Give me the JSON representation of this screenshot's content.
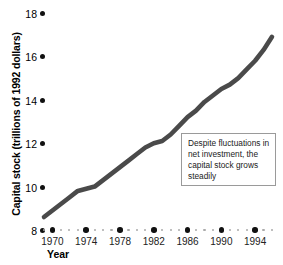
{
  "chart_data": {
    "type": "line",
    "title": "",
    "xlabel": "Year",
    "ylabel": "Capital stock (trillions of 1992 dollars)",
    "xlim": [
      1969,
      1996
    ],
    "ylim": [
      8,
      18
    ],
    "grid": false,
    "legend": null,
    "y_ticks": [
      18,
      16,
      14,
      12,
      10,
      8
    ],
    "x_ticks": [
      1970,
      1974,
      1978,
      1982,
      1986,
      1990,
      1994
    ],
    "line_color": "#4a4a4a",
    "series": [
      {
        "name": "Capital stock",
        "x": [
          1969,
          1970,
          1971,
          1972,
          1973,
          1974,
          1975,
          1976,
          1977,
          1978,
          1979,
          1980,
          1981,
          1982,
          1983,
          1984,
          1985,
          1986,
          1987,
          1988,
          1989,
          1990,
          1991,
          1992,
          1993,
          1994,
          1995,
          1996
        ],
        "values": [
          8.6,
          8.9,
          9.2,
          9.5,
          9.8,
          9.9,
          10.0,
          10.3,
          10.6,
          10.9,
          11.2,
          11.5,
          11.8,
          12.0,
          12.1,
          12.4,
          12.8,
          13.2,
          13.5,
          13.9,
          14.2,
          14.5,
          14.7,
          15.0,
          15.4,
          15.8,
          16.3,
          16.9
        ]
      }
    ],
    "annotations": [
      {
        "text": "Despite fluctuations in net investment, the capital stock grows steadily",
        "x": 1988,
        "y": 11.6
      }
    ]
  },
  "axis": {
    "y_title": "Capital stock (trillions of 1992 dollars)",
    "x_title": "Year",
    "y_tick_labels": [
      "18",
      "16",
      "14",
      "12",
      "10",
      "8"
    ],
    "x_tick_labels": [
      "1970",
      "1974",
      "1978",
      "1982",
      "1986",
      "1990",
      "1994"
    ]
  },
  "annotation": {
    "text": "Despite fluctuations in net investment, the capital stock grows steadily"
  }
}
